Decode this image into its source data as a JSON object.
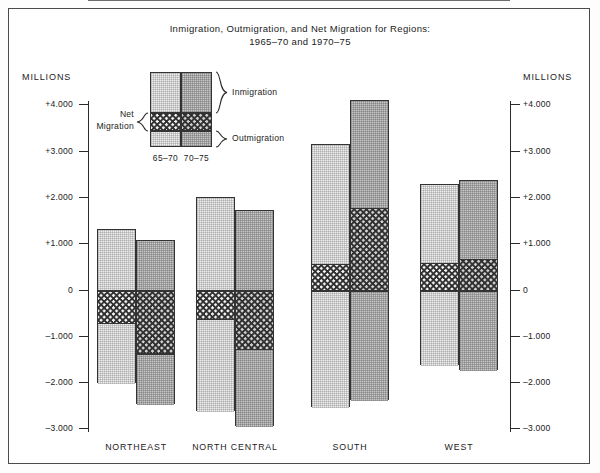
{
  "figure": {
    "title_line1": "Inmigration, Outmigration, and Net Migration for Regions:",
    "title_line2": "1965–70 and 1970–75",
    "axis_unit_label_left": "MILLIONS",
    "axis_unit_label_right": "MILLIONS"
  },
  "legend": {
    "inmigration_label": "Inmigration",
    "outmigration_label": "Outmigration",
    "net_label_line1": "Net",
    "net_label_line2": "Migration",
    "year_a": "65–70",
    "year_b": "70–75"
  },
  "colors": {
    "series_a_fill": "#eeeeee",
    "series_b_fill": "#c6c6c6",
    "net_band": "#2f2f2f",
    "outline": "#333333",
    "axis": "#2b2b2b",
    "zero_line": "#6d6d6d",
    "frame": "#4a4a4a",
    "text": "#1b1b1b"
  },
  "chart_data": {
    "type": "bar",
    "title": "Inmigration, Outmigration, and Net Migration for Regions: 1965–70 and 1970–75",
    "subtitle": "",
    "xlabel": "",
    "ylabel": "MILLIONS",
    "ylim": [
      -3.0,
      4.0
    ],
    "ytick_labels": [
      "+4.000",
      "+3.000",
      "+2.000",
      "+1.000",
      "0",
      "–1.000",
      "–2.000",
      "–3.000"
    ],
    "ytick_values": [
      4,
      3,
      2,
      1,
      0,
      -1,
      -2,
      -3
    ],
    "grid": false,
    "legend_position": "upper-left",
    "categories": [
      "NORTHEAST",
      "NORTH CENTRAL",
      "SOUTH",
      "WEST"
    ],
    "legend_entries": [
      "Inmigration",
      "Net Migration",
      "Outmigration"
    ],
    "period_labels": [
      "65–70",
      "70–75"
    ],
    "series": [
      {
        "name": "65–70",
        "inmigration": [
          1.31,
          2.01,
          3.16,
          2.3
        ],
        "outmigration": [
          -2.01,
          -2.62,
          -2.52,
          -1.63
        ],
        "net_migration": [
          -0.7,
          -0.62,
          0.58,
          0.6
        ]
      },
      {
        "name": "70–75",
        "inmigration": [
          1.07,
          1.73,
          4.11,
          2.38
        ],
        "outmigration": [
          -2.46,
          -2.93,
          -2.37,
          -1.73
        ],
        "net_migration": [
          -1.36,
          -1.27,
          1.79,
          0.68
        ]
      }
    ]
  }
}
